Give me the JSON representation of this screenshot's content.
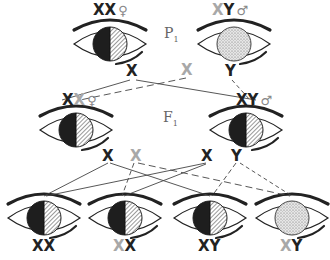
{
  "colors": {
    "ink": "#222222",
    "gray_allele": "#a8a8a8",
    "background": "#ffffff"
  },
  "generations": {
    "p1": {
      "label": "P",
      "sub": "1"
    },
    "f1": {
      "label": "F",
      "sub": "1"
    }
  },
  "p1": {
    "female": {
      "genotype_a": "X",
      "genotype_b": "X",
      "sex_symbol": "♀",
      "eye": "half-dark-half-striped",
      "gametes": [
        {
          "label": "X",
          "gray": false
        }
      ]
    },
    "male": {
      "genotype_a": "X",
      "genotype_b": "Y",
      "gray_a": true,
      "sex_symbol": "♂",
      "eye": "stippled",
      "gametes": [
        {
          "label": "X",
          "gray": true
        },
        {
          "label": "Y",
          "gray": false
        }
      ]
    }
  },
  "f1": {
    "female": {
      "genotype_a": "X",
      "genotype_b": "X",
      "gray_b": true,
      "sex_symbol": "♀",
      "eye": "half-dark-half-striped",
      "gametes": [
        {
          "label": "X",
          "gray": false
        },
        {
          "label": "X",
          "gray": true
        }
      ]
    },
    "male": {
      "genotype_a": "X",
      "genotype_b": "Y",
      "sex_symbol": "♂",
      "eye": "half-dark-half-striped",
      "gametes": [
        {
          "label": "X",
          "gray": false
        },
        {
          "label": "Y",
          "gray": false
        }
      ]
    }
  },
  "f2": [
    {
      "genotype_a": "X",
      "genotype_b": "X",
      "gray_a": false,
      "eye": "half-dark-half-striped"
    },
    {
      "genotype_a": "X",
      "genotype_b": "X",
      "gray_a": true,
      "eye": "half-dark-half-striped"
    },
    {
      "genotype_a": "X",
      "genotype_b": "Y",
      "gray_a": false,
      "eye": "half-dark-half-striped"
    },
    {
      "genotype_a": "X",
      "genotype_b": "Y",
      "gray_a": true,
      "eye": "stippled"
    }
  ]
}
